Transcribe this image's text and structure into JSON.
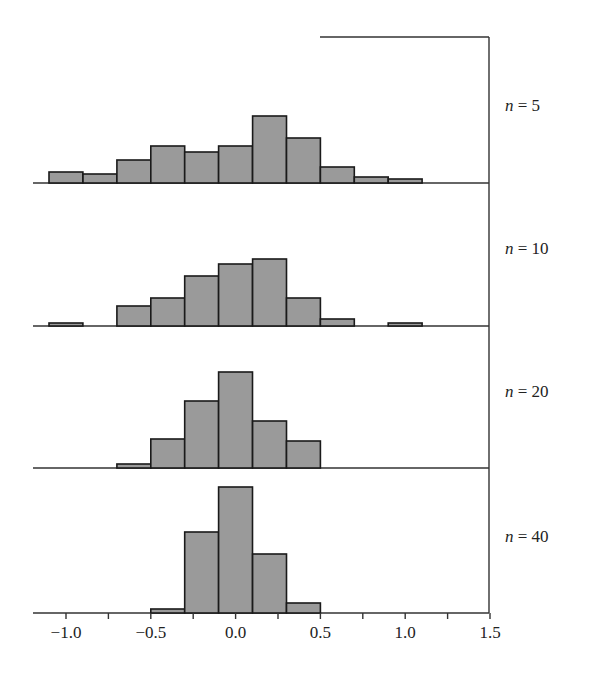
{
  "chart_data": {
    "type": "bar",
    "title": "",
    "xlabel": "",
    "ylabel": "",
    "xlim": [
      -1.2,
      1.5
    ],
    "x_ticks": [
      -1.0,
      -0.5,
      0.0,
      0.5,
      1.0,
      1.5
    ],
    "x_tick_labels": [
      "−1.0",
      "−0.5",
      "0.0",
      "0.5",
      "1.0",
      "1.5"
    ],
    "minor_ticks": [
      -0.75,
      -0.25,
      0.25,
      0.75,
      1.25
    ],
    "bin_edges": [
      -1.1,
      -0.9,
      -0.7,
      -0.5,
      -0.3,
      -0.1,
      0.1,
      0.3,
      0.5,
      0.7,
      0.9,
      1.1
    ],
    "categories": [
      "-1.0",
      "-0.8",
      "-0.6",
      "-0.4",
      "-0.2",
      "0.0",
      "0.2",
      "0.4",
      "0.6",
      "0.8",
      "1.0"
    ],
    "grid": false,
    "legend": "none",
    "panels": [
      {
        "label_var": "n",
        "label_eq": " = 5",
        "n": 5,
        "values": [
          11,
          9,
          23,
          37,
          31,
          37,
          67,
          45,
          16,
          6,
          4
        ]
      },
      {
        "label_var": "n",
        "label_eq": " = 10",
        "n": 10,
        "values": [
          3,
          0,
          20,
          28,
          50,
          62,
          67,
          28,
          7,
          0,
          3
        ]
      },
      {
        "label_var": "n",
        "label_eq": " = 20",
        "n": 20,
        "values": [
          0,
          0,
          4,
          29,
          67,
          96,
          47,
          27,
          0,
          0,
          0
        ]
      },
      {
        "label_var": "n",
        "label_eq": " = 40",
        "n": 40,
        "values": [
          0,
          0,
          0,
          4,
          81,
          126,
          59,
          10,
          0,
          0,
          0
        ]
      }
    ],
    "series": [
      {
        "name": "n = 5",
        "values": [
          11,
          9,
          23,
          37,
          31,
          37,
          67,
          45,
          16,
          6,
          4
        ]
      },
      {
        "name": "n = 10",
        "values": [
          3,
          0,
          20,
          28,
          50,
          62,
          67,
          28,
          7,
          0,
          3
        ]
      },
      {
        "name": "n = 20",
        "values": [
          0,
          0,
          4,
          29,
          67,
          96,
          47,
          27,
          0,
          0,
          0
        ]
      },
      {
        "name": "n = 40",
        "values": [
          0,
          0,
          0,
          4,
          81,
          126,
          59,
          10,
          0,
          0,
          0
        ]
      }
    ],
    "value_units": "relative bar height (px, arbitrary frequency scale)"
  },
  "style": {
    "bar_fill": "#9a9a9a",
    "bar_stroke": "#1a1a1a",
    "axis_color": "#333333"
  }
}
